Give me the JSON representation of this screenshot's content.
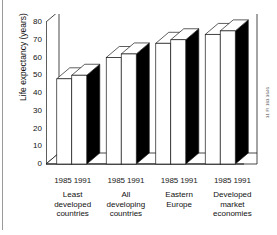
{
  "figure": {
    "ylabel": "Life expectancy (years)",
    "side_credit": "31 FI 183 3646",
    "yticks": [
      0,
      10,
      20,
      30,
      40,
      50,
      60,
      70,
      80
    ]
  },
  "chart_data": {
    "type": "bar",
    "title": "",
    "xlabel": "",
    "ylabel": "Life expectancy (years)",
    "ylim": [
      0,
      80
    ],
    "ytick_step": 10,
    "grid": false,
    "three_d": true,
    "legend": "none",
    "categories": [
      "Least developed countries",
      "All developing countries",
      "Eastern Europe",
      "Developed market economies"
    ],
    "category_lines": [
      [
        "Least",
        "developed",
        "countries"
      ],
      [
        "All",
        "developing",
        "countries"
      ],
      [
        "Eastern",
        "Europe"
      ],
      [
        "Developed",
        "market",
        "economies"
      ]
    ],
    "series": [
      {
        "name": "1985",
        "values": [
          48,
          60,
          68,
          73
        ]
      },
      {
        "name": "1991",
        "values": [
          50,
          62,
          70,
          75
        ]
      }
    ],
    "series_labels": [
      "1985",
      "1991"
    ],
    "colors": {
      "bar_face": "#ffffff",
      "bar_top": "#ffffff",
      "bar_side_shaded": "#000000",
      "outline": "#1a1a1a",
      "background": "#ffffff"
    }
  }
}
